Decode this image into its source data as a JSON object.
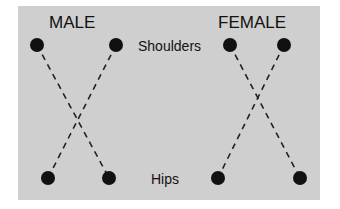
{
  "diagram": {
    "male_label": "MALE",
    "female_label": "FEMALE",
    "shoulders_label": "Shoulders",
    "hips_label": "Hips",
    "colors": {
      "background": "#cfcfcf",
      "dot": "#111111",
      "line": "#222222"
    },
    "male": {
      "shoulders": [
        [
          37,
          45
        ],
        [
          116,
          45
        ]
      ],
      "hips": [
        [
          48,
          178
        ],
        [
          109,
          178
        ]
      ]
    },
    "female": {
      "shoulders": [
        [
          230,
          45
        ],
        [
          284,
          45
        ]
      ],
      "hips": [
        [
          218,
          178
        ],
        [
          300,
          178
        ]
      ]
    }
  }
}
